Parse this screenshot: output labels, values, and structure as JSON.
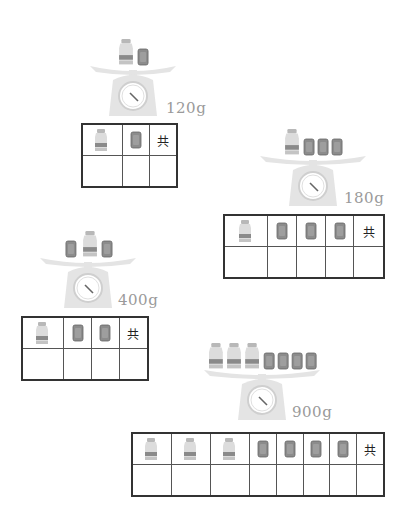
{
  "problems": [
    {
      "weight": "120g",
      "scale_items": {
        "bottles": 1,
        "boxes": 1
      },
      "grid_header": [
        "bottle",
        "box",
        "共"
      ],
      "grid_answers": [
        "",
        "",
        ""
      ]
    },
    {
      "weight": "180g",
      "scale_items": {
        "bottles": 1,
        "boxes": 3
      },
      "grid_header": [
        "bottle",
        "box",
        "box",
        "box",
        "共"
      ],
      "grid_answers": [
        "",
        "",
        "",
        "",
        ""
      ]
    },
    {
      "weight": "400g",
      "scale_items": {
        "bottles": 1,
        "boxes": 2
      },
      "grid_header": [
        "bottle",
        "box",
        "box",
        "共"
      ],
      "grid_answers": [
        "",
        "",
        "",
        ""
      ]
    },
    {
      "weight": "900g",
      "scale_items": {
        "bottles": 3,
        "boxes": 4
      },
      "grid_header": [
        "bottle",
        "bottle",
        "bottle",
        "box",
        "box",
        "box",
        "box",
        "共"
      ],
      "grid_answers": [
        "",
        "",
        "",
        "",
        "",
        "",
        "",
        ""
      ]
    }
  ],
  "total_label": "共",
  "colors": {
    "scale": "#e4e4e4",
    "box": "#8c8c8c",
    "bottle_body": "#dcdcdc",
    "bottle_band": "#8a8a8a",
    "text": "#9a9a9a"
  }
}
